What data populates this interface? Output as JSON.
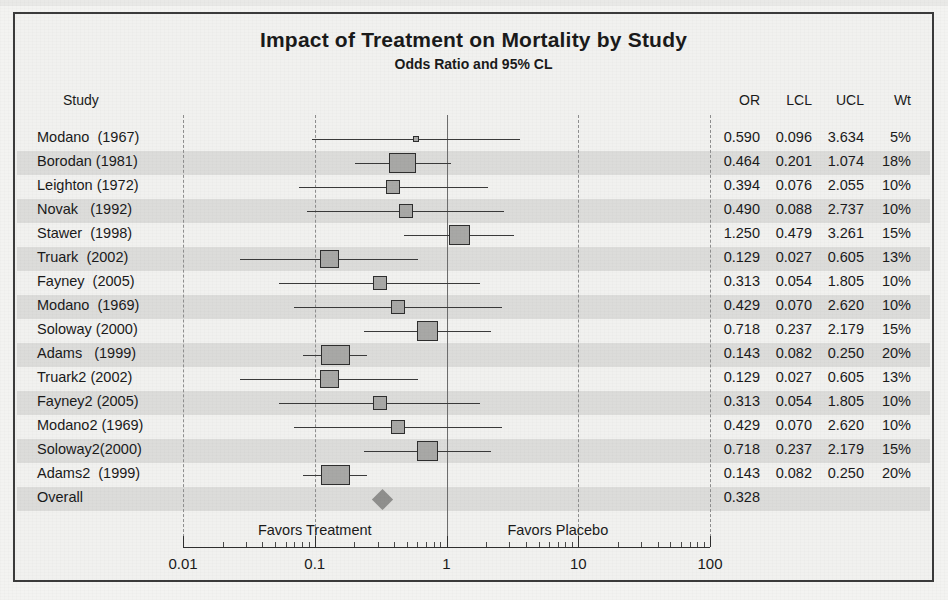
{
  "chart_data": {
    "type": "forest",
    "title": "Impact of Treatment on Mortality by Study",
    "subtitle": "Odds Ratio and 95% CL",
    "xlabel": "",
    "ylabel": "",
    "xscale": "log",
    "xlim": [
      0.01,
      100
    ],
    "xticks": [
      "0.01",
      "0.1",
      "1",
      "10",
      "100"
    ],
    "xtick_values": [
      0.01,
      0.1,
      1,
      10,
      100
    ],
    "reference_line": 1,
    "grid": true,
    "legend": "none",
    "columns": [
      "Study",
      "OR",
      "LCL",
      "UCL",
      "Wt"
    ],
    "annotations": {
      "left": "Favors Treatment",
      "right": "Favors Placebo"
    },
    "rows": [
      {
        "study": "Modano  (1967)",
        "or": 0.59,
        "lcl": 0.096,
        "ucl": 3.634,
        "wt": 5,
        "or_text": "0.590",
        "lcl_text": "0.096",
        "ucl_text": "3.634",
        "wt_text": "5%"
      },
      {
        "study": "Borodan (1981)",
        "or": 0.464,
        "lcl": 0.201,
        "ucl": 1.074,
        "wt": 18,
        "or_text": "0.464",
        "lcl_text": "0.201",
        "ucl_text": "1.074",
        "wt_text": "18%"
      },
      {
        "study": "Leighton (1972)",
        "or": 0.394,
        "lcl": 0.076,
        "ucl": 2.055,
        "wt": 10,
        "or_text": "0.394",
        "lcl_text": "0.076",
        "ucl_text": "2.055",
        "wt_text": "10%"
      },
      {
        "study": "Novak   (1992)",
        "or": 0.49,
        "lcl": 0.088,
        "ucl": 2.737,
        "wt": 10,
        "or_text": "0.490",
        "lcl_text": "0.088",
        "ucl_text": "2.737",
        "wt_text": "10%"
      },
      {
        "study": "Stawer  (1998)",
        "or": 1.25,
        "lcl": 0.479,
        "ucl": 3.261,
        "wt": 15,
        "or_text": "1.250",
        "lcl_text": "0.479",
        "ucl_text": "3.261",
        "wt_text": "15%"
      },
      {
        "study": "Truark  (2002)",
        "or": 0.129,
        "lcl": 0.027,
        "ucl": 0.605,
        "wt": 13,
        "or_text": "0.129",
        "lcl_text": "0.027",
        "ucl_text": "0.605",
        "wt_text": "13%"
      },
      {
        "study": "Fayney  (2005)",
        "or": 0.313,
        "lcl": 0.054,
        "ucl": 1.805,
        "wt": 10,
        "or_text": "0.313",
        "lcl_text": "0.054",
        "ucl_text": "1.805",
        "wt_text": "10%"
      },
      {
        "study": "Modano  (1969)",
        "or": 0.429,
        "lcl": 0.07,
        "ucl": 2.62,
        "wt": 10,
        "or_text": "0.429",
        "lcl_text": "0.070",
        "ucl_text": "2.620",
        "wt_text": "10%"
      },
      {
        "study": "Soloway (2000)",
        "or": 0.718,
        "lcl": 0.237,
        "ucl": 2.179,
        "wt": 15,
        "or_text": "0.718",
        "lcl_text": "0.237",
        "ucl_text": "2.179",
        "wt_text": "15%"
      },
      {
        "study": "Adams   (1999)",
        "or": 0.143,
        "lcl": 0.082,
        "ucl": 0.25,
        "wt": 20,
        "or_text": "0.143",
        "lcl_text": "0.082",
        "ucl_text": "0.250",
        "wt_text": "20%"
      },
      {
        "study": "Truark2 (2002)",
        "or": 0.129,
        "lcl": 0.027,
        "ucl": 0.605,
        "wt": 13,
        "or_text": "0.129",
        "lcl_text": "0.027",
        "ucl_text": "0.605",
        "wt_text": "13%"
      },
      {
        "study": "Fayney2 (2005)",
        "or": 0.313,
        "lcl": 0.054,
        "ucl": 1.805,
        "wt": 10,
        "or_text": "0.313",
        "lcl_text": "0.054",
        "ucl_text": "1.805",
        "wt_text": "10%"
      },
      {
        "study": "Modano2 (1969)",
        "or": 0.429,
        "lcl": 0.07,
        "ucl": 2.62,
        "wt": 10,
        "or_text": "0.429",
        "lcl_text": "0.070",
        "ucl_text": "2.620",
        "wt_text": "10%"
      },
      {
        "study": "Soloway2(2000)",
        "or": 0.718,
        "lcl": 0.237,
        "ucl": 2.179,
        "wt": 15,
        "or_text": "0.718",
        "lcl_text": "0.237",
        "ucl_text": "2.179",
        "wt_text": "15%"
      },
      {
        "study": "Adams2  (1999)",
        "or": 0.143,
        "lcl": 0.082,
        "ucl": 0.25,
        "wt": 20,
        "or_text": "0.143",
        "lcl_text": "0.082",
        "ucl_text": "0.250",
        "wt_text": "20%"
      },
      {
        "study": "Overall",
        "or": 0.328,
        "lcl": null,
        "ucl": null,
        "wt": null,
        "or_text": "0.328",
        "lcl_text": "",
        "ucl_text": "",
        "wt_text": "",
        "summary": true
      }
    ]
  },
  "colors": {
    "paper": "#f3f3f1",
    "frame": "#3b3b3b",
    "band": "#dcdcda",
    "marker_fill": "#a8a8a6",
    "marker_edge": "#2e2e2e",
    "ci_line": "#3a3a3a",
    "gridline": "#8e8e8e",
    "refline": "#6d6d6d",
    "diamond": "#8f8f8d",
    "text": "#1a1a1a"
  }
}
